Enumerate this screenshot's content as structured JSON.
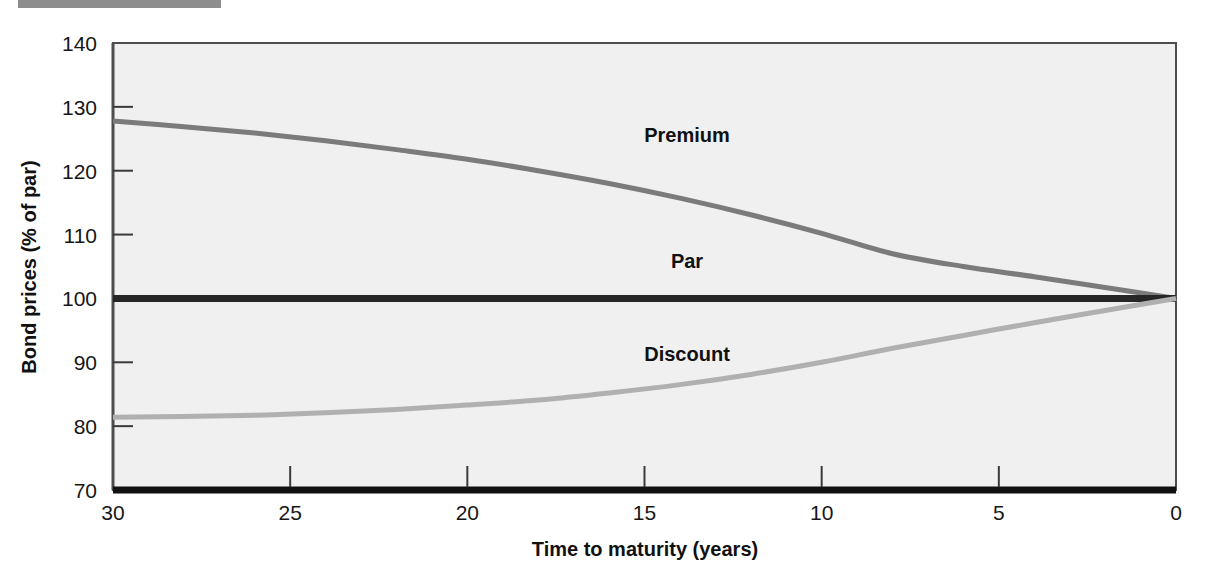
{
  "figure": {
    "top_rule_color": "#8d8d8d",
    "plot_background": "#f0f0f0",
    "border_color": "#4d4d4d"
  },
  "chart_data": {
    "type": "line",
    "title": "",
    "xlabel": "Time to maturity (years)",
    "ylabel": "Bond prices (% of par)",
    "xlim": [
      30,
      0
    ],
    "ylim": [
      70,
      140
    ],
    "x_ticks": [
      "30",
      "25",
      "20",
      "15",
      "10",
      "5",
      "0"
    ],
    "x_tick_values": [
      30,
      25,
      20,
      15,
      10,
      5,
      0
    ],
    "y_ticks": [
      "140",
      "130",
      "120",
      "110",
      "100",
      "90",
      "80",
      "70"
    ],
    "y_tick_values": [
      140,
      130,
      120,
      110,
      100,
      90,
      80,
      70
    ],
    "grid": false,
    "legend": "inline-annotations",
    "x": [
      30,
      28,
      26,
      24,
      22,
      20,
      18,
      16,
      14,
      12,
      10,
      8,
      6,
      4,
      2,
      0
    ],
    "series": [
      {
        "name": "Premium",
        "color": "#7b7b7b",
        "label_x": 13.8,
        "label_y": 124.5,
        "values": [
          127.8,
          126.9,
          125.9,
          124.7,
          123.3,
          121.8,
          120.0,
          118.0,
          115.7,
          113.1,
          110.2,
          107.0,
          105.0,
          103.4,
          101.7,
          100.0
        ]
      },
      {
        "name": "Par",
        "color": "#262626",
        "label_x": 13.8,
        "label_y": 104.8,
        "values": [
          100,
          100,
          100,
          100,
          100,
          100,
          100,
          100,
          100,
          100,
          100,
          100,
          100,
          100,
          100,
          100
        ]
      },
      {
        "name": "Discount",
        "color": "#b0b0b0",
        "label_x": 13.8,
        "label_y": 90.2,
        "values": [
          81.4,
          81.5,
          81.7,
          82.1,
          82.6,
          83.3,
          84.1,
          85.2,
          86.5,
          88.1,
          90.0,
          92.2,
          94.2,
          96.2,
          98.1,
          100.0
        ]
      }
    ],
    "annotations": [
      {
        "text": "Premium",
        "x": 13.8,
        "y": 124.5
      },
      {
        "text": "Par",
        "x": 13.8,
        "y": 104.8
      },
      {
        "text": "Discount",
        "x": 13.8,
        "y": 90.2
      }
    ]
  }
}
